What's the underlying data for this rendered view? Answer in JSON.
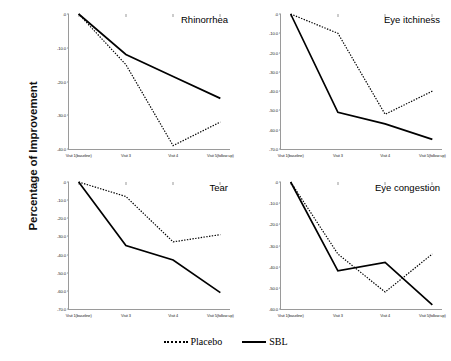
{
  "axis_title": "Percentage of Improvement",
  "legend": {
    "placebo_label": "Placebo",
    "sbl_label": "SBL"
  },
  "chart_data": [
    {
      "type": "line",
      "title": "Rhinorrhea",
      "xlabel": "",
      "ylabel": "Percentage of Improvement",
      "categories": [
        "Visit 1(baseline)",
        "Visit 3",
        "Visit 4",
        "Visit 5(follow up)"
      ],
      "ylim": [
        -40,
        0
      ],
      "yticks": [
        0.0,
        -10.0,
        -20.0,
        -30.0,
        -40.0
      ],
      "yticklabels": [
        ".0",
        "-10.0",
        "-20.0",
        "-30.0",
        "-40.0"
      ],
      "grid": false,
      "legend_position": "bottom",
      "series": [
        {
          "name": "Placebo",
          "style": "dotted",
          "values": [
            0.0,
            -15.0,
            -39.0,
            -32.0
          ]
        },
        {
          "name": "SBL",
          "style": "solid",
          "values": [
            0.0,
            -12.0,
            -18.5,
            -25.0
          ]
        }
      ]
    },
    {
      "type": "line",
      "title": "Eye itchiness",
      "xlabel": "",
      "ylabel": "Percentage of Improvement",
      "categories": [
        "Visit 1(baseline)",
        "Visit 3",
        "Visit 4",
        "Visit 5(follow up)"
      ],
      "ylim": [
        -70,
        0
      ],
      "yticks": [
        0.0,
        -10.0,
        -20.0,
        -30.0,
        -40.0,
        -50.0,
        -60.0,
        -70.0
      ],
      "yticklabels": [
        ".0",
        "-10.0",
        "-20.0",
        "-30.0",
        "-40.0",
        "-50.0",
        "-60.0",
        "-70.0"
      ],
      "grid": false,
      "legend_position": "bottom",
      "series": [
        {
          "name": "Placebo",
          "style": "dotted",
          "values": [
            0.0,
            -10.0,
            -52.0,
            -40.0
          ]
        },
        {
          "name": "SBL",
          "style": "solid",
          "values": [
            0.0,
            -51.0,
            -57.0,
            -65.0
          ]
        }
      ]
    },
    {
      "type": "line",
      "title": "Tear",
      "xlabel": "",
      "ylabel": "Percentage of Improvement",
      "categories": [
        "Visit 1(baseline)",
        "Visit 3",
        "Visit 4",
        "Visit 5(follow up)"
      ],
      "ylim": [
        -70,
        0
      ],
      "yticks": [
        0.0,
        -10.0,
        -20.0,
        -30.0,
        -40.0,
        -50.0,
        -60.0,
        -70.0
      ],
      "yticklabels": [
        ".0",
        "-10.0",
        "-20.0",
        "-30.0",
        "-40.0",
        "-50.0",
        "-60.0",
        "-70.0"
      ],
      "grid": false,
      "legend_position": "bottom",
      "series": [
        {
          "name": "Placebo",
          "style": "dotted",
          "values": [
            0.0,
            -8.0,
            -33.0,
            -29.0
          ]
        },
        {
          "name": "SBL",
          "style": "solid",
          "values": [
            0.0,
            -35.0,
            -43.0,
            -61.0
          ]
        }
      ]
    },
    {
      "type": "line",
      "title": "Eye congestion",
      "xlabel": "",
      "ylabel": "Percentage of Improvement",
      "categories": [
        "Visit 1(baseline)",
        "Visit 3",
        "Visit 4",
        "Visit 5(follow up)"
      ],
      "ylim": [
        -60,
        0
      ],
      "yticks": [
        0.0,
        -10.0,
        -20.0,
        -30.0,
        -40.0,
        -50.0,
        -60.0
      ],
      "yticklabels": [
        ".0",
        "-10.0",
        "-20.0",
        "-30.0",
        "-40.0",
        "-50.0",
        "-60.0"
      ],
      "grid": false,
      "legend_position": "bottom",
      "series": [
        {
          "name": "Placebo",
          "style": "dotted",
          "values": [
            0.0,
            -34.0,
            -52.0,
            -34.0
          ]
        },
        {
          "name": "SBL",
          "style": "solid",
          "values": [
            0.0,
            -42.0,
            -38.0,
            -58.0
          ]
        }
      ]
    }
  ]
}
